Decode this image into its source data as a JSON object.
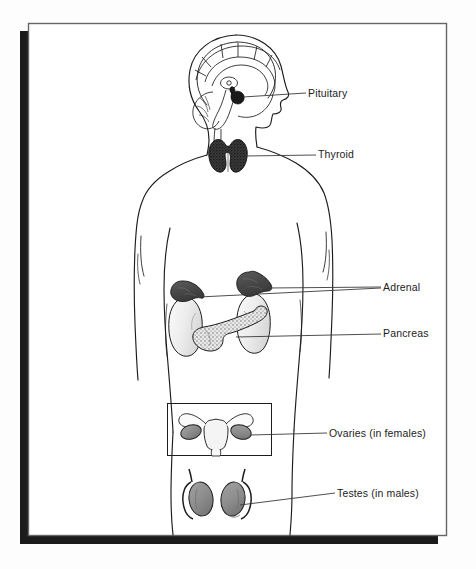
{
  "figure": {
    "view": "posterior/anterior body outline with organ insets"
  },
  "frame": {
    "border_color": "#666666",
    "shadow_color": "#1b1b1b",
    "page_color": "#ffffff",
    "backdrop_color": "#fdfdfd"
  },
  "palette": {
    "outline": "#1c1c1c",
    "leader_line": "#3a3a3a",
    "gland_dark": "#4a4a4a",
    "gland_mid": "#8c8c8c",
    "organ_light": "#ececec",
    "organ_lighter": "#f6f6f6",
    "text": "#1c1c1c"
  },
  "labels": [
    {
      "id": "pituitary",
      "text": "Pituitary",
      "x": 308,
      "y": 97
    },
    {
      "id": "thyroid",
      "text": "Thyroid",
      "x": 318,
      "y": 158
    },
    {
      "id": "adrenal",
      "text": "Adrenal",
      "x": 383,
      "y": 291
    },
    {
      "id": "pancreas",
      "text": "Pancreas",
      "x": 383,
      "y": 337
    },
    {
      "id": "ovaries",
      "text": "Ovaries (in females)",
      "x": 329,
      "y": 437
    },
    {
      "id": "testes",
      "text": "Testes (in males)",
      "x": 337,
      "y": 497
    }
  ],
  "organs": [
    {
      "id": "pituitary",
      "name": "Pituitary gland",
      "shade": "dark"
    },
    {
      "id": "thyroid",
      "name": "Thyroid gland",
      "shade": "dark"
    },
    {
      "id": "adrenal-left",
      "name": "Left adrenal gland",
      "shade": "dark"
    },
    {
      "id": "adrenal-right",
      "name": "Right adrenal gland",
      "shade": "dark"
    },
    {
      "id": "kidney-left",
      "name": "Left kidney",
      "shade": "light"
    },
    {
      "id": "kidney-right",
      "name": "Right kidney",
      "shade": "light"
    },
    {
      "id": "pancreas",
      "name": "Pancreas",
      "shade": "stippled"
    },
    {
      "id": "uterus",
      "name": "Uterus with fallopian tubes",
      "shade": "light"
    },
    {
      "id": "ovary-left",
      "name": "Left ovary",
      "shade": "mid"
    },
    {
      "id": "ovary-right",
      "name": "Right ovary",
      "shade": "mid"
    },
    {
      "id": "testis-left",
      "name": "Left testis",
      "shade": "mid"
    },
    {
      "id": "testis-right",
      "name": "Right testis",
      "shade": "mid"
    }
  ]
}
